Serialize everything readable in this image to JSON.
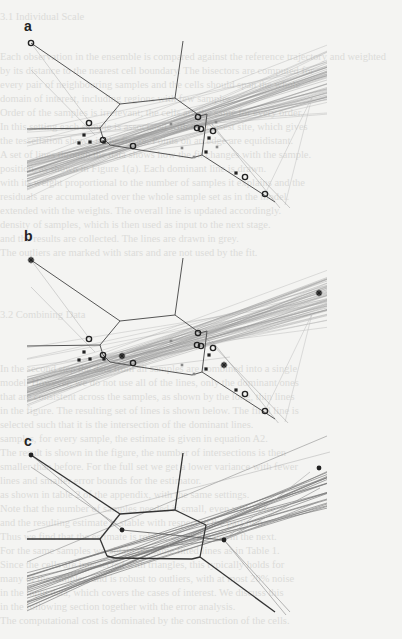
{
  "page": {
    "background_text_lines": [
      {
        "y": 20,
        "text": "3.1    Individual Scale"
      },
      {
        "y": 60,
        "text": "Each observation in the ensemble is compared against the reference trajectory and weighted"
      },
      {
        "y": 74,
        "text": "by its distance to the nearest cell boundary. The bisectors are computed for"
      },
      {
        "y": 88,
        "text": "every pair of neighbouring samples and the cells should span the whole"
      },
      {
        "y": 102,
        "text": "domain of interest, including regions with few samples."
      },
      {
        "y": 116,
        "text": "    Order of the samples is irrelevant; the cells are the same for every order."
      },
      {
        "y": 130,
        "text": "In this setting each sample is associated with the closest site, which gives"
      },
      {
        "y": 144,
        "text": "the tessellation shown in the figure. Points on an edge are equidistant."
      },
      {
        "y": 158,
        "text": "A set of lines through the data shows how the fit changes with the sample."
      },
      {
        "y": 172,
        "text": "position, as shown in Figure 1(a). Each dominant line is drawn."
      },
      {
        "y": 186,
        "text": "with its weight proportional to the number of samples it explains and the"
      },
      {
        "y": 200,
        "text": "residuals are accumulated over the whole sample set as in the model."
      },
      {
        "y": 214,
        "text": "extended with the weights. The overall line is updated accordingly."
      },
      {
        "y": 228,
        "text": "density of samples, which is then used as input to the next stage."
      },
      {
        "y": 242,
        "text": "and the results are collected. The lines are drawn in grey."
      },
      {
        "y": 256,
        "text": "The outliers are marked with stars and are not used by the fit."
      },
      {
        "y": 318,
        "text": "3.2    Combining Data"
      },
      {
        "y": 372,
        "text": "In the second step the data from all samples are combined into a single"
      },
      {
        "y": 386,
        "text": "model. However, we do not use all of the lines, only the dominant ones"
      },
      {
        "y": 400,
        "text": "that are consistent across the samples, as shown by the long, thin lines"
      },
      {
        "y": 414,
        "text": "in the figure. The resulting set of lines is shown below. The final line is"
      },
      {
        "y": 428,
        "text": "selected such that it is the intersection of the dominant lines."
      },
      {
        "y": 442,
        "text": "samples, for every sample, the estimate is given in equation A2."
      },
      {
        "y": 456,
        "text": "    The result is shown in the figure, the number of intersections is then"
      },
      {
        "y": 470,
        "text": "smaller than before. For the full set we get a lower variance with fewer"
      },
      {
        "y": 484,
        "text": "lines and smaller error bounds for the estimator."
      },
      {
        "y": 498,
        "text": "as shown in table 2 of the appendix, with the same settings."
      },
      {
        "y": 512,
        "text": "    Note that the number of samples needed is small, even with noise,"
      },
      {
        "y": 526,
        "text": "and the resulting estimate is stable with respect to the partition."
      },
      {
        "y": 540,
        "text": "Thus we find that the estimate is robust, as we discuss in the next."
      },
      {
        "y": 554,
        "text": "For the same samples we obtain the same fitted lines as in Table 1."
      },
      {
        "y": 568,
        "text": "    Since the cells are intersected with triangles, this typically holds for"
      },
      {
        "y": 582,
        "text": "many of the samples, and is robust to outliers, with at most 20% noise"
      },
      {
        "y": 596,
        "text": "in the input data, which covers the cases of interest. We discuss this"
      },
      {
        "y": 610,
        "text": "in the following section together with the error analysis."
      },
      {
        "y": 624,
        "text": "The computational cost is dominated by the construction of the cells."
      }
    ]
  },
  "figure": {
    "panels": [
      {
        "label": "a",
        "label_pos": [
          24,
          18
        ],
        "offset_y": 0,
        "edge_color": "#555555",
        "band_color": "#8a8a8a",
        "sites": [
          {
            "x": 31,
            "y": 43,
            "kind": "circle"
          },
          {
            "x": 89,
            "y": 123,
            "kind": "circle"
          },
          {
            "x": 103,
            "y": 140,
            "kind": "circle"
          },
          {
            "x": 133,
            "y": 146,
            "kind": "circle"
          },
          {
            "x": 198,
            "y": 117,
            "kind": "circle"
          },
          {
            "x": 197,
            "y": 128,
            "kind": "circle"
          },
          {
            "x": 201,
            "y": 129,
            "kind": "circle"
          },
          {
            "x": 213,
            "y": 131,
            "kind": "circle"
          },
          {
            "x": 245,
            "y": 177,
            "kind": "circle"
          },
          {
            "x": 265,
            "y": 194,
            "kind": "circle"
          },
          {
            "x": 84,
            "y": 135,
            "kind": "square"
          },
          {
            "x": 79,
            "y": 143,
            "kind": "square"
          },
          {
            "x": 90,
            "y": 142,
            "kind": "square"
          },
          {
            "x": 104,
            "y": 142,
            "kind": "square"
          },
          {
            "x": 171,
            "y": 124,
            "kind": "small"
          },
          {
            "x": 216,
            "y": 122,
            "kind": "small"
          },
          {
            "x": 209,
            "y": 138,
            "kind": "square"
          },
          {
            "x": 182,
            "y": 148,
            "kind": "small"
          },
          {
            "x": 217,
            "y": 147,
            "kind": "small"
          },
          {
            "x": 206,
            "y": 152,
            "kind": "square"
          },
          {
            "x": 194,
            "y": 157,
            "kind": "small"
          },
          {
            "x": 236,
            "y": 173,
            "kind": "square"
          }
        ],
        "voronoi_edges": [
          [
            [
              31,
              43
            ],
            [
              120,
              104
            ]
          ],
          [
            [
              120,
              104
            ],
            [
              175,
              98
            ]
          ],
          [
            [
              175,
              98
            ],
            [
              183,
              41
            ]
          ],
          [
            [
              175,
              98
            ],
            [
              200,
              116
            ]
          ],
          [
            [
              200,
              116
            ],
            [
              207,
              114
            ]
          ],
          [
            [
              207,
              114
            ],
            [
              202,
              155
            ]
          ],
          [
            [
              202,
              155
            ],
            [
              192,
              158
            ]
          ],
          [
            [
              120,
              104
            ],
            [
              100,
              128
            ]
          ],
          [
            [
              100,
              128
            ],
            [
              27,
              129
            ]
          ],
          [
            [
              100,
              128
            ],
            [
              103,
              138
            ]
          ],
          [
            [
              103,
              138
            ],
            [
              110,
              145
            ]
          ],
          [
            [
              110,
              145
            ],
            [
              140,
              150
            ]
          ],
          [
            [
              140,
              150
            ],
            [
              192,
              158
            ]
          ],
          [
            [
              202,
              155
            ],
            [
              275,
              202
            ]
          ]
        ]
      },
      {
        "label": "b",
        "label_pos": [
          24,
          228
        ],
        "offset_y": 208,
        "edge_color": "#555555",
        "band_color": "#8a8a8a",
        "sites": [
          {
            "x": 31,
            "y": 52,
            "kind": "star"
          },
          {
            "x": 89,
            "y": 131,
            "kind": "circle"
          },
          {
            "x": 103,
            "y": 147,
            "kind": "circle"
          },
          {
            "x": 122,
            "y": 148,
            "kind": "star"
          },
          {
            "x": 133,
            "y": 155,
            "kind": "circle"
          },
          {
            "x": 198,
            "y": 125,
            "kind": "circle"
          },
          {
            "x": 197,
            "y": 137,
            "kind": "circle"
          },
          {
            "x": 201,
            "y": 138,
            "kind": "circle"
          },
          {
            "x": 213,
            "y": 140,
            "kind": "circle"
          },
          {
            "x": 224,
            "y": 157,
            "kind": "star"
          },
          {
            "x": 245,
            "y": 186,
            "kind": "circle"
          },
          {
            "x": 265,
            "y": 203,
            "kind": "circle"
          },
          {
            "x": 319,
            "y": 85,
            "kind": "star"
          },
          {
            "x": 84,
            "y": 144,
            "kind": "square"
          },
          {
            "x": 79,
            "y": 152,
            "kind": "square"
          },
          {
            "x": 90,
            "y": 151,
            "kind": "square"
          },
          {
            "x": 104,
            "y": 151,
            "kind": "square"
          },
          {
            "x": 171,
            "y": 133,
            "kind": "small"
          },
          {
            "x": 209,
            "y": 147,
            "kind": "square"
          },
          {
            "x": 182,
            "y": 157,
            "kind": "small"
          },
          {
            "x": 206,
            "y": 161,
            "kind": "square"
          },
          {
            "x": 194,
            "y": 166,
            "kind": "small"
          },
          {
            "x": 236,
            "y": 182,
            "kind": "square"
          }
        ],
        "voronoi_edges": [
          [
            [
              31,
              52
            ],
            [
              120,
              113
            ]
          ],
          [
            [
              120,
              113
            ],
            [
              175,
              107
            ]
          ],
          [
            [
              175,
              107
            ],
            [
              183,
              50
            ]
          ],
          [
            [
              175,
              107
            ],
            [
              200,
              125
            ]
          ],
          [
            [
              200,
              125
            ],
            [
              207,
              123
            ]
          ],
          [
            [
              207,
              123
            ],
            [
              202,
              164
            ]
          ],
          [
            [
              202,
              164
            ],
            [
              192,
              167
            ]
          ],
          [
            [
              120,
              113
            ],
            [
              100,
              137
            ]
          ],
          [
            [
              100,
              137
            ],
            [
              27,
              138
            ]
          ],
          [
            [
              100,
              137
            ],
            [
              103,
              147
            ]
          ],
          [
            [
              103,
              147
            ],
            [
              110,
              154
            ]
          ],
          [
            [
              110,
              154
            ],
            [
              140,
              159
            ]
          ],
          [
            [
              140,
              159
            ],
            [
              192,
              167
            ]
          ],
          [
            [
              202,
              164
            ],
            [
              275,
              211
            ]
          ]
        ]
      },
      {
        "label": "c",
        "label_pos": [
          24,
          433
        ],
        "offset_y": 412,
        "edge_color": "#333333",
        "band_color": "#777777",
        "sites": [
          {
            "x": 31,
            "y": 43,
            "kind": "dot"
          },
          {
            "x": 122,
            "y": 118,
            "kind": "dot"
          },
          {
            "x": 224,
            "y": 128,
            "kind": "dot"
          },
          {
            "x": 319,
            "y": 56,
            "kind": "dot"
          }
        ],
        "voronoi_edges": [
          [
            [
              31,
              43
            ],
            [
              120,
              102
            ]
          ],
          [
            [
              120,
              102
            ],
            [
              175,
              98
            ]
          ],
          [
            [
              175,
              98
            ],
            [
              183,
              41
            ]
          ],
          [
            [
              175,
              98
            ],
            [
              206,
              113
            ]
          ],
          [
            [
              206,
              113
            ],
            [
              200,
              145
            ]
          ],
          [
            [
              200,
              145
            ],
            [
              192,
              147
            ]
          ],
          [
            [
              120,
              102
            ],
            [
              100,
              127
            ]
          ],
          [
            [
              100,
              127
            ],
            [
              27,
              127
            ]
          ],
          [
            [
              100,
              127
            ],
            [
              107,
              144
            ]
          ],
          [
            [
              107,
              144
            ],
            [
              115,
              146
            ]
          ],
          [
            [
              115,
              146
            ],
            [
              192,
              147
            ]
          ],
          [
            [
              200,
              145
            ],
            [
              275,
              200
            ]
          ]
        ]
      }
    ],
    "band_lines_dense": 40,
    "band_lines_sparse": 14
  }
}
